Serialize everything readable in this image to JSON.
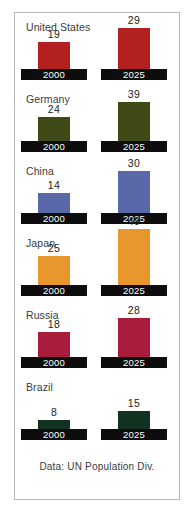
{
  "footer": {
    "source_note": "Data: UN Population Div."
  },
  "chart_data": {
    "type": "bar",
    "title": "",
    "xlabel": "",
    "ylabel": "",
    "categories": [
      "United States",
      "Germany",
      "China",
      "Japan",
      "Russia",
      "Brazil"
    ],
    "series": [
      {
        "name": "2000",
        "values": [
          19,
          24,
          14,
          25,
          18,
          8
        ]
      },
      {
        "name": "2025",
        "values": [
          29,
          39,
          30,
          49,
          28,
          15
        ]
      }
    ],
    "series_labels": [
      "2000",
      "2025"
    ],
    "legend_position": "none",
    "grid": false,
    "ylim": [
      0,
      49
    ],
    "colors": {
      "United States": "#b32020",
      "Germany": "#3f4a16",
      "China": "#5968a8",
      "Japan": "#e8972e",
      "Russia": "#a81c3c",
      "Brazil": "#123322",
      "plinth": "#0d0d0d",
      "frame": "#b9b9b9",
      "background": "#ffffff"
    },
    "rows": [
      {
        "country": "United States",
        "color": "#b32020",
        "label_top": 8,
        "plinth_top": 56,
        "bars": [
          {
            "period": "2000",
            "value": 19,
            "height": 27
          },
          {
            "period": "2025",
            "value": 29,
            "height": 41
          }
        ]
      },
      {
        "country": "Germany",
        "color": "#3f4a16",
        "label_top": 80,
        "plinth_top": 128,
        "bars": [
          {
            "period": "2000",
            "value": 24,
            "height": 24
          },
          {
            "period": "2025",
            "value": 39,
            "height": 39
          }
        ]
      },
      {
        "country": "China",
        "color": "#5968a8",
        "label_top": 152,
        "plinth_top": 200,
        "bars": [
          {
            "period": "2000",
            "value": 14,
            "height": 20
          },
          {
            "period": "2025",
            "value": 30,
            "height": 42
          }
        ]
      },
      {
        "country": "Japan",
        "color": "#e8972e",
        "label_top": 224,
        "plinth_top": 272,
        "bars": [
          {
            "period": "2000",
            "value": 25,
            "height": 29
          },
          {
            "period": "2025",
            "value": 49,
            "height": 56
          }
        ]
      },
      {
        "country": "Russia",
        "color": "#a81c3c",
        "label_top": 296,
        "plinth_top": 344,
        "bars": [
          {
            "period": "2000",
            "value": 18,
            "height": 25
          },
          {
            "period": "2025",
            "value": 28,
            "height": 39
          }
        ]
      },
      {
        "country": "Brazil",
        "color": "#123322",
        "label_top": 368,
        "plinth_top": 416,
        "bars": [
          {
            "period": "2000",
            "value": 8,
            "height": 9
          },
          {
            "period": "2025",
            "value": 15,
            "height": 18
          }
        ]
      }
    ],
    "footer_top": 448
  }
}
